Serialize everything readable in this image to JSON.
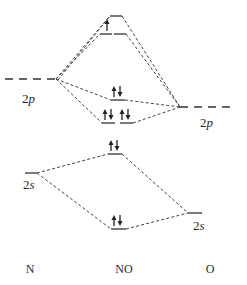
{
  "diagram": {
    "type": "molecular-orbital-diagram",
    "molecule": "NO",
    "columns": {
      "left": "N",
      "center": "NO",
      "right": "O"
    },
    "atomic_orbitals": {
      "N": [
        {
          "label_num": "2",
          "label_sub": "p"
        },
        {
          "label_num": "2",
          "label_sub": "s"
        }
      ],
      "O": [
        {
          "label_num": "2",
          "label_sub": "p"
        },
        {
          "label_num": "2",
          "label_sub": "s"
        }
      ]
    },
    "molecular_orbitals": [
      {
        "name": "sigma-star-2p",
        "electrons": "",
        "degenerate": 1
      },
      {
        "name": "pi-star-2p",
        "electrons": "↑",
        "degenerate": 2
      },
      {
        "name": "sigma-2p",
        "electrons": "↑↓",
        "degenerate": 1
      },
      {
        "name": "pi-2p",
        "electrons": "↑↓ ↑↓",
        "degenerate": 2
      },
      {
        "name": "sigma-star-2s",
        "electrons": "↑↓",
        "degenerate": 1
      },
      {
        "name": "sigma-2s",
        "electrons": "↑↓",
        "degenerate": 1
      }
    ]
  }
}
